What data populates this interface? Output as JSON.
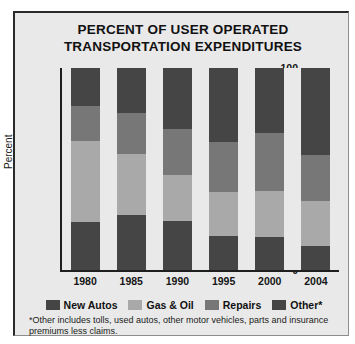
{
  "chart_data": {
    "type": "bar",
    "title": "PERCENT OF USER OPERATED TRANSPORTATION EXPENDITURES",
    "title_line1": "PERCENT OF USER OPERATED",
    "title_line2": "TRANSPORTATION EXPENDITURES",
    "subtitle": "",
    "stacked": true,
    "xlabel": "",
    "ylabel": "Percent",
    "ylim": [
      0,
      100
    ],
    "yticks": [
      100,
      80,
      60,
      40,
      20,
      0
    ],
    "grid": false,
    "legend_position": "bottom",
    "categories": [
      "1980",
      "1985",
      "1990",
      "1995",
      "2000",
      "2004"
    ],
    "series": [
      {
        "name": "New Autos",
        "color": "#454545",
        "values": [
          24,
          27,
          24.5,
          17,
          16.5,
          12
        ]
      },
      {
        "name": "Gas & Oil",
        "color": "#a9a9a9",
        "values": [
          40,
          30.5,
          22.5,
          21.5,
          22.5,
          22
        ]
      },
      {
        "name": "Repairs",
        "color": "#777777",
        "values": [
          17,
          20,
          23,
          25,
          29,
          23
        ]
      },
      {
        "name": "Other*",
        "color": "#454545",
        "values": [
          19,
          22.5,
          30,
          36.5,
          32,
          43
        ]
      }
    ],
    "annotations": [
      "*Other includes tolls, used autos, other motor vehicles, parts and insurance premiums less claims."
    ]
  },
  "footnote": "*Other includes tolls, used autos, other motor vehicles, parts and insurance premiums less claims."
}
